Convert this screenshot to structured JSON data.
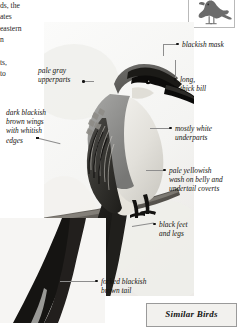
{
  "body_text": {
    "paragraph_1": [
      "ds, the",
      "ates",
      "eastern",
      "n"
    ],
    "paragraph_2": [
      "ts,",
      "to"
    ]
  },
  "thumbnail": {
    "icon": "bird-silhouette-icon"
  },
  "photo": {
    "subject": "perched-kingbird-photograph"
  },
  "annotations": [
    {
      "id": "blackish-mask",
      "lines": [
        "blackish mask"
      ]
    },
    {
      "id": "long-thick-bill",
      "lines": [
        "long,",
        "thick bill"
      ]
    },
    {
      "id": "pale-gray-upperparts",
      "lines": [
        "pale gray",
        "upperparts"
      ]
    },
    {
      "id": "dark-blackish-brown-wings",
      "lines": [
        "dark blackish",
        "brown wings",
        "with whitish",
        "edges"
      ]
    },
    {
      "id": "mostly-white-underparts",
      "lines": [
        "mostly white",
        "underparts"
      ]
    },
    {
      "id": "pale-yellowish-wash",
      "lines": [
        "pale yellowish",
        "wash on belly and",
        "undertail coverts"
      ]
    },
    {
      "id": "black-feet-and-legs",
      "lines": [
        "black feet",
        "and legs"
      ]
    },
    {
      "id": "forked-blackish-brown-tail",
      "lines": [
        "forked blackish",
        "brown tail"
      ]
    }
  ],
  "similar_birds": {
    "title": "Similar Birds"
  }
}
